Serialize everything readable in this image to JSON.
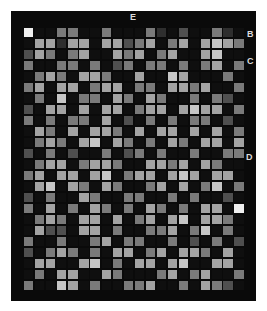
{
  "figure": {
    "labels": {
      "e": "E",
      "b": "B",
      "c": "C",
      "d": "D"
    }
  },
  "chart_data": {
    "type": "heatmap",
    "rows": 24,
    "cols": 20,
    "title": "",
    "annotations": [
      "E",
      "B",
      "C",
      "D"
    ],
    "legend": "none",
    "palette": {
      "0": "#0f0f0f",
      "1": "#2e2e2e",
      "2": "#4f4f4f",
      "3": "#7a7a7a",
      "4": "#a3a3a3",
      "5": "#c6c6c6",
      "6": "#efefef"
    },
    "background_color": "#0a0a0a",
    "page_color": "#ffffff",
    "cells": [
      "60033003000310200310",
      "04414404423403404543",
      "24303400434034004500",
      "30033030230330303403",
      "03430443004005400030",
      "34044034403304434003",
      "03050330430430030320",
      "20440404403440454403",
      "30303304020303033020",
      "04304044304044040403",
      "03430450430304304404",
      "20302003023030030033",
      "03440344300443404300",
      "34044045034404540440",
      "04504304300340403503",
      "20300430033003030020",
      "30403043030430304406",
      "03430440403404504430",
      "04220440300334035030",
      "30030034033003020302",
      "20343030440340443040",
      "04400450304404500440",
      "03044004300034034003",
      "30054030033400304320"
    ]
  }
}
